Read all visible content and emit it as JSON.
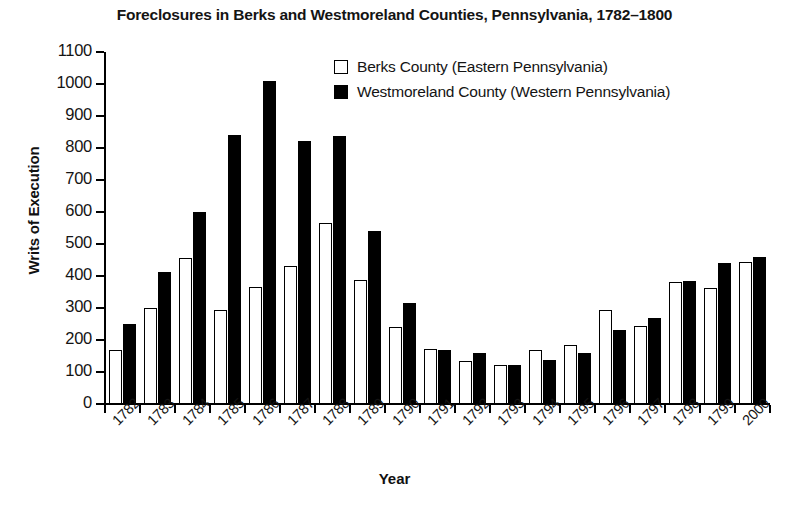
{
  "chart_data": {
    "type": "bar",
    "title": "Foreclosures in Berks and Westmoreland Counties, Pennsylvania, 1782–1800",
    "xlabel": "Year",
    "ylabel": "Writs of Execution",
    "ylim": [
      0,
      1100
    ],
    "ytick_step": 100,
    "yticks": [
      0,
      100,
      200,
      300,
      400,
      500,
      600,
      700,
      800,
      900,
      1000,
      1100
    ],
    "ytick_labels": [
      "0",
      "100",
      "200",
      "300",
      "400",
      "500",
      "600",
      "700",
      "800",
      "900",
      "1000",
      "1100"
    ],
    "grid": false,
    "legend_position": "top-center",
    "categories": [
      "1782",
      "1783",
      "1784",
      "1785",
      "1786",
      "1787",
      "1788",
      "1789",
      "1790",
      "1791",
      "1792",
      "1793",
      "1794",
      "1795",
      "1796",
      "1797",
      "1798",
      "1799",
      "2000"
    ],
    "series": [
      {
        "name": "Berks County (Eastern Pennsylvania)",
        "color": "#ffffff",
        "edge_color": "#000000",
        "values": [
          170,
          300,
          455,
          293,
          367,
          430,
          565,
          388,
          242,
          172,
          135,
          122,
          170,
          185,
          293,
          243,
          380,
          363,
          443
        ]
      },
      {
        "name": "Westmoreland County (Western Pennsylvania)",
        "color": "#000000",
        "edge_color": "#000000",
        "values": [
          250,
          412,
          600,
          840,
          1008,
          823,
          838,
          540,
          315,
          168,
          158,
          122,
          138,
          158,
          232,
          268,
          385,
          440,
          460
        ]
      }
    ]
  },
  "legend": {
    "items": [
      {
        "label": "Berks County (Eastern Pennsylvania)",
        "style": "open"
      },
      {
        "label": "Westmoreland County (Western Pennsylvania)",
        "style": "filled"
      }
    ]
  }
}
